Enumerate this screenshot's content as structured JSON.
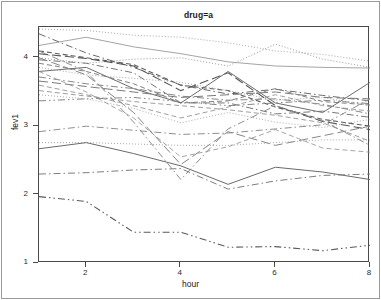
{
  "figure": {
    "strip_label": "drug=a",
    "x_axis_title": "hour",
    "y_axis_title": "fev1"
  },
  "chart_data": {
    "type": "line",
    "title": "drug=a",
    "subtitle": "",
    "xlabel": "hour",
    "ylabel": "fev1",
    "xlim": [
      1,
      8
    ],
    "ylim": [
      1,
      4.45
    ],
    "xticks": [
      2,
      4,
      6,
      8
    ],
    "yticks": [
      1,
      2,
      3,
      4
    ],
    "grid": false,
    "legend": "none",
    "x": [
      1,
      2,
      3,
      4,
      5,
      6,
      7,
      8
    ],
    "annotations": [
      "Spaghetti plot of individual subject fev1 trajectories over hours for drug = a",
      "Lines drawn with varying dash patterns (solid, dotted, dashed, dash-dot) and gray shades"
    ],
    "series": [
      {
        "name": "subj-01",
        "dash": "dotted",
        "shade": "#9d9d9d",
        "width": 0.9,
        "values": [
          4.42,
          4.4,
          4.33,
          4.3,
          4.22,
          4.1,
          4.05,
          3.95
        ]
      },
      {
        "name": "subj-02",
        "dash": "solid",
        "shade": "#9a9a9a",
        "width": 0.9,
        "values": [
          4.18,
          4.3,
          4.16,
          4.06,
          3.94,
          3.88,
          3.86,
          3.85
        ]
      },
      {
        "name": "subj-03",
        "dash": "dotted",
        "shade": "#8f8f8f",
        "width": 0.9,
        "values": [
          4.0,
          3.92,
          3.98,
          4.0,
          3.88,
          4.2,
          3.98,
          3.86
        ]
      },
      {
        "name": "subj-04",
        "dash": "dashdot",
        "shade": "#6b6b6b",
        "width": 1.0,
        "values": [
          4.35,
          4.07,
          3.86,
          3.6,
          3.47,
          3.54,
          3.45,
          3.37
        ]
      },
      {
        "name": "subj-05",
        "dash": "dashed",
        "shade": "#5f5f5f",
        "width": 1.1,
        "values": [
          4.1,
          4.0,
          3.9,
          3.6,
          3.52,
          3.28,
          3.1,
          3.0
        ]
      },
      {
        "name": "subj-06",
        "dash": "longdash",
        "shade": "#565656",
        "width": 1.1,
        "values": [
          4.06,
          3.99,
          3.88,
          3.52,
          3.78,
          3.3,
          3.07,
          2.95
        ]
      },
      {
        "name": "subj-07",
        "dash": "dashdot",
        "shade": "#777777",
        "width": 1.0,
        "values": [
          3.97,
          3.92,
          3.78,
          3.34,
          3.34,
          3.18,
          3.22,
          3.13
        ]
      },
      {
        "name": "subj-08",
        "dash": "dashed",
        "shade": "#828282",
        "width": 1.0,
        "values": [
          3.92,
          3.8,
          3.62,
          3.34,
          3.37,
          3.55,
          3.36,
          3.31
        ]
      },
      {
        "name": "subj-09",
        "dash": "solid",
        "shade": "#6e6e6e",
        "width": 1.0,
        "values": [
          3.8,
          3.86,
          3.55,
          3.34,
          3.8,
          3.34,
          3.2,
          3.64
        ]
      },
      {
        "name": "subj-10",
        "dash": "dotted",
        "shade": "#9c9c9c",
        "width": 0.9,
        "values": [
          3.86,
          3.75,
          3.7,
          3.64,
          3.52,
          3.38,
          3.42,
          3.3
        ]
      },
      {
        "name": "subj-11",
        "dash": "dashdot",
        "shade": "#888888",
        "width": 1.0,
        "values": [
          3.72,
          3.62,
          3.55,
          3.44,
          3.38,
          3.4,
          3.32,
          3.18
        ]
      },
      {
        "name": "subj-12",
        "dash": "longdash",
        "shade": "#7a7a7a",
        "width": 1.0,
        "values": [
          3.66,
          3.58,
          3.5,
          3.42,
          3.46,
          3.5,
          3.42,
          3.4
        ]
      },
      {
        "name": "subj-13",
        "dash": "dashed",
        "shade": "#959595",
        "width": 0.9,
        "values": [
          3.6,
          3.46,
          3.3,
          3.12,
          3.28,
          3.46,
          3.3,
          3.22
        ]
      },
      {
        "name": "subj-14",
        "dash": "dashdotdot",
        "shade": "#858585",
        "width": 1.0,
        "values": [
          3.37,
          3.4,
          3.42,
          3.36,
          3.3,
          3.34,
          3.38,
          3.33
        ]
      },
      {
        "name": "subj-15",
        "dash": "dotted",
        "shade": "#a2a2a2",
        "width": 0.9,
        "values": [
          3.46,
          3.4,
          3.26,
          3.05,
          3.2,
          3.06,
          2.98,
          3.1
        ]
      },
      {
        "name": "subj-16",
        "dash": "dashdot",
        "shade": "#909090",
        "width": 1.0,
        "values": [
          2.92,
          3.0,
          2.94,
          2.88,
          2.9,
          2.96,
          3.02,
          3.4
        ]
      },
      {
        "name": "subj-17",
        "dash": "dashed",
        "shade": "#9b9b9b",
        "width": 0.9,
        "values": [
          3.8,
          3.5,
          3.12,
          2.55,
          2.7,
          2.95,
          2.68,
          2.62
        ]
      },
      {
        "name": "subj-18",
        "dash": "longdash",
        "shade": "#868686",
        "width": 1.0,
        "values": [
          4.0,
          3.75,
          3.2,
          2.44,
          2.92,
          2.72,
          2.86,
          3.0
        ]
      },
      {
        "name": "subj-19",
        "dash": "dashdot",
        "shade": "#8d8d8d",
        "width": 1.0,
        "values": [
          4.1,
          3.8,
          3.06,
          2.22,
          2.96,
          3.3,
          3.08,
          2.72
        ]
      },
      {
        "name": "subj-20",
        "dash": "dotted",
        "shade": "#a0a0a0",
        "width": 0.9,
        "values": [
          2.76,
          2.76,
          2.74,
          2.72,
          2.72,
          2.76,
          2.8,
          2.8
        ]
      },
      {
        "name": "subj-21",
        "dash": "solid",
        "shade": "#6a6a6a",
        "width": 1.0,
        "values": [
          2.67,
          2.76,
          2.6,
          2.42,
          2.15,
          2.4,
          2.33,
          2.22
        ]
      },
      {
        "name": "subj-22",
        "dash": "dashdot",
        "shade": "#7d7d7d",
        "width": 1.0,
        "values": [
          2.3,
          2.32,
          2.36,
          2.38,
          2.08,
          2.2,
          2.28,
          2.3
        ]
      },
      {
        "name": "subj-23",
        "dash": "dashdotdot",
        "shade": "#5a5a5a",
        "width": 1.1,
        "values": [
          1.97,
          1.9,
          1.45,
          1.45,
          1.23,
          1.24,
          1.18,
          1.26
        ]
      },
      {
        "name": "subj-24",
        "dash": "dashed",
        "shade": "#939393",
        "width": 0.9,
        "values": [
          3.52,
          3.44,
          3.36,
          3.3,
          3.24,
          3.16,
          3.05,
          2.78
        ]
      }
    ]
  }
}
